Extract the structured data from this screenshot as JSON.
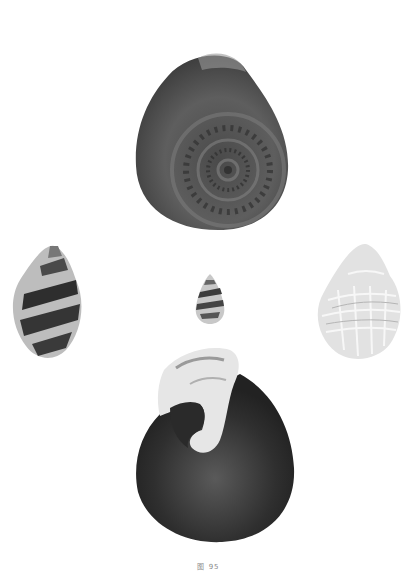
{
  "plate": {
    "caption": "图 95",
    "background": "#ffffff"
  },
  "figures": [
    {
      "name": "top-shell",
      "description": "large coiled snail shell, apical view, dark gray with spiral nodules",
      "tone": "#555555"
    },
    {
      "name": "left-shell",
      "description": "small conical shell with dark banded pattern",
      "tone": "#3a3a3a"
    },
    {
      "name": "center-shell",
      "description": "tiny turreted shell with bands",
      "tone": "#6a6a6a"
    },
    {
      "name": "right-shell",
      "description": "pale ribbed whelk-like shell",
      "tone": "#d8d8d8"
    },
    {
      "name": "bottom-shell",
      "description": "large dark globular shell, apertural view with pale lip",
      "tone": "#2e2e2e"
    }
  ]
}
